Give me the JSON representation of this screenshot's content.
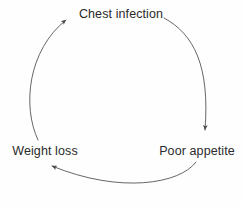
{
  "diagram": {
    "type": "cycle",
    "background_color": "#fefefe",
    "stroke_color": "#555555",
    "text_color": "#2b2b2b",
    "nodes": [
      {
        "id": "chest-infection",
        "label": "Chest infection",
        "position": "top"
      },
      {
        "id": "poor-appetite",
        "label": "Poor appetite",
        "position": "bottom-right"
      },
      {
        "id": "weight-loss",
        "label": "Weight loss",
        "position": "bottom-left"
      }
    ],
    "edges": [
      {
        "id": "edge-chest-to-appetite",
        "from": "Chest infection",
        "to": "Poor appetite",
        "shape": "arc-right",
        "arrowhead": "end"
      },
      {
        "id": "edge-appetite-to-weight",
        "from": "Poor appetite",
        "to": "Weight loss",
        "shape": "arc-bottom",
        "arrowhead": "end"
      },
      {
        "id": "edge-weight-to-chest",
        "from": "Weight loss",
        "to": "Chest infection",
        "shape": "arc-left",
        "arrowhead": "end"
      }
    ],
    "watermark": ""
  }
}
